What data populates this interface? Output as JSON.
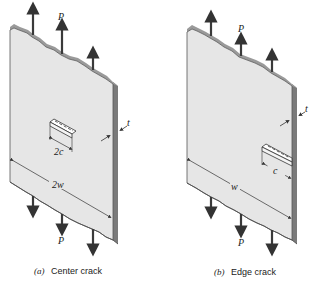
{
  "figure": {
    "panels": [
      {
        "id": "a",
        "caption_letter": "(a)",
        "caption_text": "Center crack",
        "load_label": "P",
        "thickness_label": "t",
        "crack_length_label": "2c",
        "width_label": "2w"
      },
      {
        "id": "b",
        "caption_letter": "(b)",
        "caption_text": "Edge crack",
        "load_label": "P",
        "thickness_label": "t",
        "crack_length_label": "c",
        "width_label": "w"
      }
    ],
    "colors": {
      "plate_face": "#e6e6e6",
      "plate_side": "#7a7a7a",
      "plate_edge": "#555555",
      "arrow": "#3a3a3a",
      "text": "#222222"
    }
  }
}
